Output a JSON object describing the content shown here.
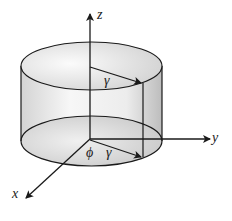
{
  "diagram": {
    "axes": {
      "x_label": "x",
      "y_label": "y",
      "z_label": "z"
    },
    "annotations": {
      "radius_top": "γ",
      "radius_bottom": "γ",
      "angle": "ϕ"
    },
    "colors": {
      "stroke": "#1a1a1a",
      "fill_light": "#f2f2f2",
      "fill_dark": "#c8c8c8"
    }
  }
}
